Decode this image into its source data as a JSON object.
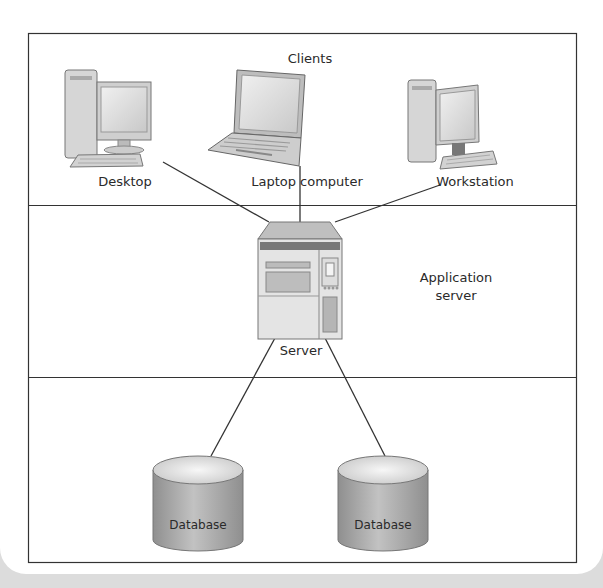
{
  "diagram": {
    "tiers": [
      {
        "id": "clients",
        "label": "Clients"
      },
      {
        "id": "application",
        "label": "Application\nserver",
        "label_line1": "Application",
        "label_line2": "server"
      },
      {
        "id": "data",
        "label": ""
      }
    ],
    "nodes": {
      "desktop": {
        "label": "Desktop",
        "icon": "desktop-computer-icon"
      },
      "laptop": {
        "label": "Laptop computer",
        "icon": "laptop-icon"
      },
      "workstation": {
        "label": "Workstation",
        "icon": "workstation-icon"
      },
      "server": {
        "label": "Server",
        "icon": "server-icon"
      },
      "database_1": {
        "label": "Database",
        "icon": "database-cylinder-icon"
      },
      "database_2": {
        "label": "Database",
        "icon": "database-cylinder-icon"
      }
    },
    "edges": [
      {
        "from": "desktop",
        "to": "server"
      },
      {
        "from": "laptop",
        "to": "server"
      },
      {
        "from": "workstation",
        "to": "server"
      },
      {
        "from": "server",
        "to": "database_1"
      },
      {
        "from": "server",
        "to": "database_2"
      }
    ],
    "colors": {
      "line": "#333333",
      "device_fill": "#d8d8d8",
      "device_dark": "#8a8a8a",
      "db_fill": "#a9a9a9",
      "db_top": "#e6e6e6"
    }
  }
}
